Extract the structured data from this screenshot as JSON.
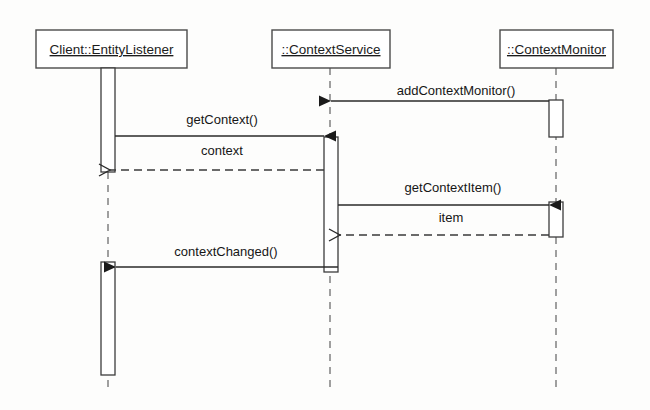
{
  "diagram": {
    "type": "uml-sequence-diagram",
    "title": "",
    "background_color": "#fdfdfc",
    "line_color": "#2a2a2a",
    "box_fill": "#ffffff"
  },
  "lifelines": [
    {
      "id": "entity-listener",
      "label": "Client::EntityListener",
      "box": {
        "x": 36,
        "y": 30,
        "width": 151,
        "height": 38
      },
      "line_x": 108,
      "line_bottom": 390,
      "activations": [
        {
          "x": 101,
          "y": 68,
          "width": 14,
          "height": 104
        },
        {
          "x": 101,
          "y": 262,
          "width": 14,
          "height": 113
        }
      ]
    },
    {
      "id": "context-service",
      "label": "::ContextService",
      "box": {
        "x": 272,
        "y": 30,
        "width": 118,
        "height": 38
      },
      "line_x": 330,
      "line_bottom": 390,
      "activations": [
        {
          "x": 324,
          "y": 137,
          "width": 14,
          "height": 135
        }
      ]
    },
    {
      "id": "context-monitor",
      "label": "::ContextMonitor",
      "box": {
        "x": 500,
        "y": 30,
        "width": 113,
        "height": 38
      },
      "line_x": 556,
      "line_bottom": 390,
      "activations": [
        {
          "x": 549,
          "y": 100,
          "width": 14,
          "height": 37
        },
        {
          "x": 549,
          "y": 202,
          "width": 14,
          "height": 35
        }
      ]
    }
  ],
  "messages": [
    {
      "id": "add-context-monitor",
      "label": "addContextMonitor()",
      "from": "context-monitor",
      "to": "context-service",
      "direction": "left",
      "style": "solid",
      "y": 101,
      "x_start": 549,
      "x_end": 331,
      "label_x": 456,
      "label_y": 95
    },
    {
      "id": "get-context",
      "label": "getContext()",
      "from": "entity-listener",
      "to": "context-service",
      "direction": "right",
      "style": "solid",
      "y": 136,
      "x_start": 115,
      "x_end": 324,
      "label_x": 222,
      "label_y": 124
    },
    {
      "id": "context-return",
      "label": "context",
      "from": "context-service",
      "to": "entity-listener",
      "direction": "left",
      "style": "dashed",
      "y": 170,
      "x_start": 324,
      "x_end": 110,
      "label_x": 222,
      "label_y": 155
    },
    {
      "id": "get-context-item",
      "label": "getContextItem()",
      "from": "context-service",
      "to": "context-monitor",
      "direction": "right",
      "style": "solid",
      "y": 205,
      "x_start": 338,
      "x_end": 549,
      "label_x": 453,
      "label_y": 192
    },
    {
      "id": "item-return",
      "label": "item",
      "from": "context-monitor",
      "to": "context-service",
      "direction": "left",
      "style": "dashed",
      "y": 235,
      "x_start": 549,
      "x_end": 340,
      "label_x": 451,
      "label_y": 222
    },
    {
      "id": "context-changed",
      "label": "contextChanged()",
      "from": "context-service",
      "to": "entity-listener",
      "direction": "left",
      "style": "solid",
      "y": 267,
      "x_start": 338,
      "x_end": 116,
      "label_x": 226,
      "label_y": 256
    }
  ]
}
